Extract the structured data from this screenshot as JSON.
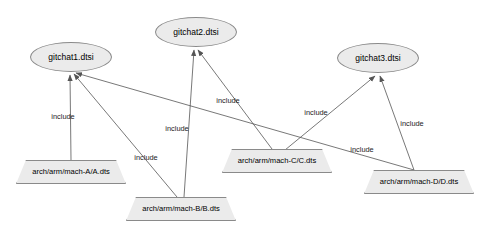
{
  "diagram": {
    "background_color": "#ffffff",
    "node_fill_color": "#ebebeb",
    "node_stroke_color": "#8a8a8a",
    "edge_color": "#555555",
    "text_color": "#000000",
    "width": 483,
    "height": 236,
    "ellipse_nodes": [
      {
        "id": "gitchat1",
        "label": "gitchat1.dtsi",
        "cx": 71,
        "cy": 57,
        "rx": 41,
        "ry": 15
      },
      {
        "id": "gitchat2",
        "label": "gitchat2.dtsi",
        "cx": 196,
        "cy": 32,
        "rx": 41,
        "ry": 15
      },
      {
        "id": "gitchat3",
        "label": "gitchat3.dtsi",
        "cx": 378,
        "cy": 58,
        "rx": 41,
        "ry": 15
      }
    ],
    "trapezoid_nodes": [
      {
        "id": "machA",
        "label": "arch/arm/mach-A/A.dts",
        "cx": 71,
        "cy": 172,
        "w": 110,
        "h": 24
      },
      {
        "id": "machB",
        "label": "arch/arm/mach-B/B.dts",
        "cx": 181,
        "cy": 209,
        "w": 110,
        "h": 24
      },
      {
        "id": "machC",
        "label": "arch/arm/mach-C/C.dts",
        "cx": 277,
        "cy": 161,
        "w": 110,
        "h": 24
      },
      {
        "id": "machD",
        "label": "arch/arm/mach-D/D.dts",
        "cx": 419,
        "cy": 182,
        "w": 110,
        "h": 24
      }
    ],
    "edges": [
      {
        "id": "e1",
        "from": "machA",
        "to": "gitchat1",
        "label": "include",
        "x1": 71,
        "y1": 160,
        "x2": 70,
        "y2": 75,
        "lx": 63,
        "ly": 117
      },
      {
        "id": "e2",
        "from": "machB",
        "to": "gitchat1",
        "label": "include",
        "x1": 177,
        "y1": 197,
        "x2": 74,
        "y2": 74,
        "lx": 146,
        "ly": 158
      },
      {
        "id": "e3",
        "from": "machD",
        "to": "gitchat1",
        "label": "include",
        "x1": 414,
        "y1": 170,
        "x2": 76,
        "y2": 73,
        "lx": 362,
        "ly": 150
      },
      {
        "id": "e4",
        "from": "machB",
        "to": "gitchat2",
        "label": "include",
        "x1": 184,
        "y1": 197,
        "x2": 194,
        "y2": 50,
        "lx": 177,
        "ly": 129
      },
      {
        "id": "e5",
        "from": "machC",
        "to": "gitchat2",
        "label": "include",
        "x1": 272,
        "y1": 149,
        "x2": 198,
        "y2": 50,
        "lx": 228,
        "ly": 101
      },
      {
        "id": "e6",
        "from": "machC",
        "to": "gitchat3",
        "label": "include",
        "x1": 285,
        "y1": 150,
        "x2": 375,
        "y2": 76,
        "lx": 316,
        "ly": 113
      },
      {
        "id": "e7",
        "from": "machD",
        "to": "gitchat3",
        "label": "include",
        "x1": 414,
        "y1": 170,
        "x2": 380,
        "y2": 76,
        "lx": 412,
        "ly": 124
      }
    ]
  }
}
